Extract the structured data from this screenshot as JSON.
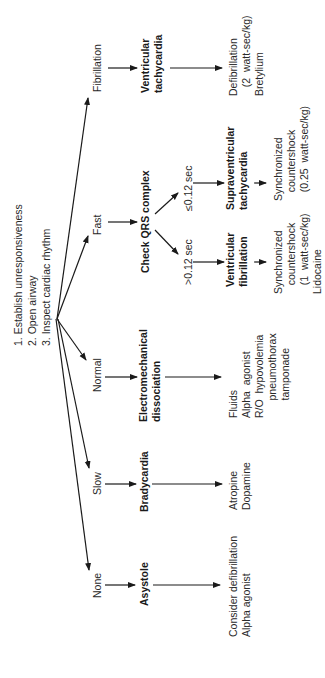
{
  "steps": [
    "1.  Establish unresponsiveness",
    "2.  Open airway",
    "3.  Inspect cardiac rhythm"
  ],
  "rhythms": {
    "fibrillation": "Fibrillation",
    "fast": "Fast",
    "normal": "Normal",
    "slow": "Slow",
    "none": "None"
  },
  "check_qrs": "Check QRS complex",
  "qrs_branches": {
    "narrow": "≤0.12 sec",
    "wide": ">0.12 sec"
  },
  "diagnoses": {
    "vt": [
      "Ventricular",
      "tachycardia"
    ],
    "svt": [
      "Supraventricular",
      "tachycardia"
    ],
    "vf": [
      "Ventricular",
      "fibrillation"
    ],
    "emd": [
      "Electromechanical",
      "dissociation"
    ],
    "brady": [
      "Bradycardia"
    ],
    "asystole": [
      "Asystole"
    ]
  },
  "treatments": {
    "vt": [
      "Defibrillation",
      "   (2  watt-sec/kg)",
      "Bretylium"
    ],
    "svt": [
      "Synchronized",
      "   countershock",
      "   (0.25  watt-sec/kg)"
    ],
    "vf": [
      "Synchronized",
      "   countershock",
      "   (1  watt-sec/kg)",
      "Lidocaine"
    ],
    "emd": [
      "Fluids",
      "Alpha  agonist",
      "R/O  hypovolemia",
      "      pneumothorax",
      "      tamponade"
    ],
    "brady": [
      "Atropine",
      "Dopamine"
    ],
    "asystole": [
      "Consider defibrillation",
      "Alpha agonist"
    ]
  }
}
